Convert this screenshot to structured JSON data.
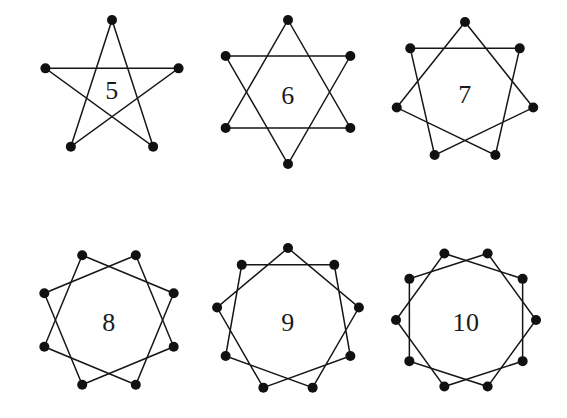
{
  "figure": {
    "background_color": "#ffffff",
    "line_color": "#161616",
    "vertex_color": "#111111",
    "label_color": "#1a1a1a",
    "width": 567,
    "height": 418,
    "rows": 2,
    "columns": 3
  },
  "chart_data": {
    "type": "diagram",
    "xlabel": "",
    "ylabel": "",
    "grid": false,
    "legend": null,
    "items": [
      {
        "label": "5",
        "points": 5,
        "step": 2,
        "schlafli": "{5/2}",
        "center_x": 112,
        "center_y": 90,
        "radius": 70,
        "start_angle_deg": -90,
        "label_x": 112,
        "label_y": 90
      },
      {
        "label": "6",
        "points": 6,
        "step": 2,
        "schlafli": "{6/2}",
        "center_x": 288,
        "center_y": 92,
        "radius": 72,
        "start_angle_deg": -90,
        "label_x": 288,
        "label_y": 95
      },
      {
        "label": "7",
        "points": 7,
        "step": 2,
        "schlafli": "{7/2}",
        "center_x": 465,
        "center_y": 92,
        "radius": 70,
        "start_angle_deg": -90,
        "label_x": 465,
        "label_y": 94
      },
      {
        "label": "8",
        "points": 8,
        "step": 2,
        "schlafli": "{8/2}",
        "center_x": 109,
        "center_y": 320,
        "radius": 70,
        "start_angle_deg": -67.5,
        "label_x": 109,
        "label_y": 322
      },
      {
        "label": "9",
        "points": 9,
        "step": 2,
        "schlafli": "{9/2}",
        "center_x": 288,
        "center_y": 320,
        "radius": 72,
        "start_angle_deg": -90,
        "label_x": 288,
        "label_y": 322
      },
      {
        "label": "10",
        "points": 10,
        "step": 2,
        "schlafli": "{10/2}",
        "center_x": 466,
        "center_y": 320,
        "radius": 70,
        "start_angle_deg": -72,
        "label_x": 466,
        "label_y": 322
      }
    ]
  }
}
